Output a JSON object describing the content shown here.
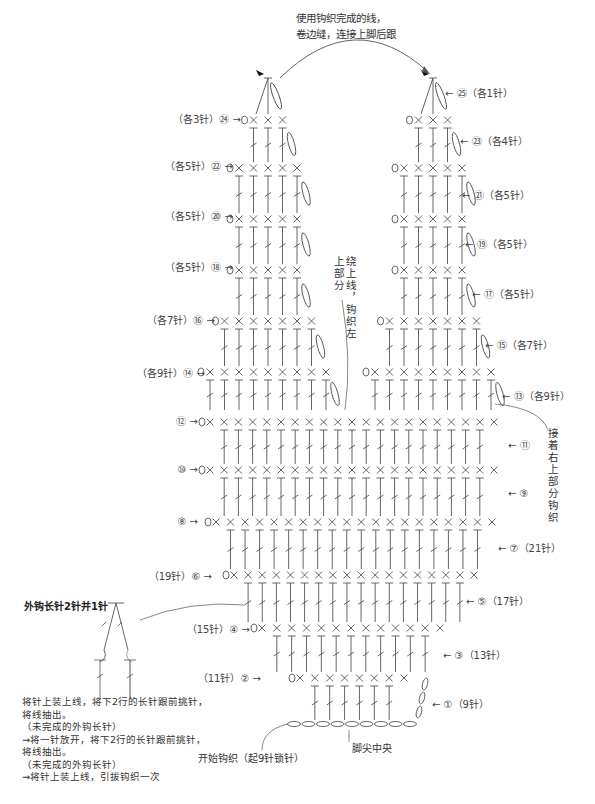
{
  "diagram": {
    "type": "crochet-chart",
    "top_note": [
      "使用钩织完成的线，",
      "卷边缝，连接上脚后跟"
    ],
    "left_upper_note": "绕上线，钩织左上部分",
    "right_note": "接着右上部分钩织",
    "start_note": "开始钩织（起9针锁针）",
    "toe_center_note": "脚尖中央",
    "left_labels": [
      {
        "row": "㉔",
        "text": "（各3针）㉔ →"
      },
      {
        "row": "㉒",
        "text": "（各5针）㉒ →"
      },
      {
        "row": "⑳",
        "text": "（各5针）⑳ →"
      },
      {
        "row": "⑱",
        "text": "（各5针）⑱ →"
      },
      {
        "row": "⑯",
        "text": "（各7针）⑯ →"
      },
      {
        "row": "⑭",
        "text": "（各9针）⑭ →"
      },
      {
        "row": "⑫",
        "text": "⑫ →"
      },
      {
        "row": "⑩",
        "text": "⑩ →"
      },
      {
        "row": "⑧",
        "text": "⑧ →"
      },
      {
        "row": "⑥",
        "text": "（19针）⑥ →"
      },
      {
        "row": "④",
        "text": "（15针）④ →"
      },
      {
        "row": "②",
        "text": "（11针）② →"
      }
    ],
    "right_labels": [
      {
        "row": "㉕",
        "text": "← ㉕（各1针）"
      },
      {
        "row": "㉓",
        "text": "← ㉓（各4针）"
      },
      {
        "row": "㉑",
        "text": "← ㉑（各5针）"
      },
      {
        "row": "⑲",
        "text": "← ⑲（各5针）"
      },
      {
        "row": "⑰",
        "text": "← ⑰（各5针）"
      },
      {
        "row": "⑮",
        "text": "← ⑮（各7针）"
      },
      {
        "row": "⑬",
        "text": "← ⑬（各9针）"
      },
      {
        "row": "⑪",
        "text": "← ⑪"
      },
      {
        "row": "⑨",
        "text": "← ⑨"
      },
      {
        "row": "⑦",
        "text": "← ⑦（21针）"
      },
      {
        "row": "⑤",
        "text": "← ⑤（17针）"
      },
      {
        "row": "③",
        "text": "← ③（13针）"
      },
      {
        "row": "①",
        "text": "← ①（9针）"
      }
    ],
    "legend": {
      "title": "外钩长针2针并1针",
      "lines": [
        "将针上装上线，将下2行的长针跟前挑针，",
        "将线抽出。",
        "（未完成的外钩长针）",
        "→将一针放开，将下2行的长针跟前挑针，",
        "将线抽出。",
        "（未完成的外钩长针）",
        "→将针上装上线，引拔钩织一次"
      ]
    },
    "colors": {
      "line": "#555555",
      "text": "#333333",
      "background": "#ffffff"
    }
  }
}
